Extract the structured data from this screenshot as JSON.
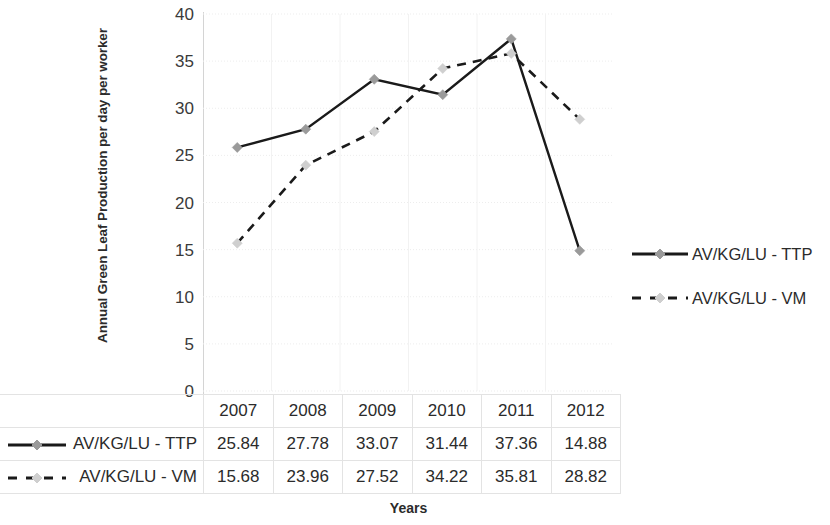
{
  "chart_data": {
    "type": "line",
    "title": "",
    "xlabel": "Years",
    "ylabel": "Annual Green Leaf Production per day per worker",
    "categories": [
      "2007",
      "2008",
      "2009",
      "2010",
      "2011",
      "2012"
    ],
    "series": [
      {
        "name": "AV/KG/LU - TTP",
        "values": [
          25.84,
          27.78,
          33.07,
          31.44,
          37.36,
          14.88
        ],
        "line_style": "solid",
        "color": "#1a1a1a",
        "marker": "diamond",
        "marker_color": "#9a9a9a"
      },
      {
        "name": "AV/KG/LU - VM",
        "values": [
          15.68,
          23.96,
          27.52,
          34.22,
          35.81,
          28.82
        ],
        "line_style": "dashed",
        "color": "#1a1a1a",
        "marker": "diamond",
        "marker_color": "#cfcfcf"
      }
    ],
    "ylim": [
      0,
      40
    ],
    "ytick_step": 5,
    "yticks": [
      "0",
      "5",
      "10",
      "15",
      "20",
      "25",
      "30",
      "35",
      "40"
    ],
    "grid": true,
    "grid_color": "#ededed",
    "legend_position": "right",
    "data_table_visible": true
  },
  "axis": {
    "y_title": "Annual Green Leaf Production per day per worker",
    "x_title": "Years"
  },
  "legend": {
    "items": [
      {
        "label": "AV/KG/LU - TTP"
      },
      {
        "label": "AV/KG/LU - VM"
      }
    ]
  },
  "table": {
    "header": [
      "2007",
      "2008",
      "2009",
      "2010",
      "2011",
      "2012"
    ],
    "rows": [
      {
        "label": "AV/KG/LU - TTP",
        "values": [
          "25.84",
          "27.78",
          "33.07",
          "31.44",
          "37.36",
          "14.88"
        ]
      },
      {
        "label": "AV/KG/LU - VM",
        "values": [
          "15.68",
          "23.96",
          "27.52",
          "34.22",
          "35.81",
          "28.82"
        ]
      }
    ]
  }
}
